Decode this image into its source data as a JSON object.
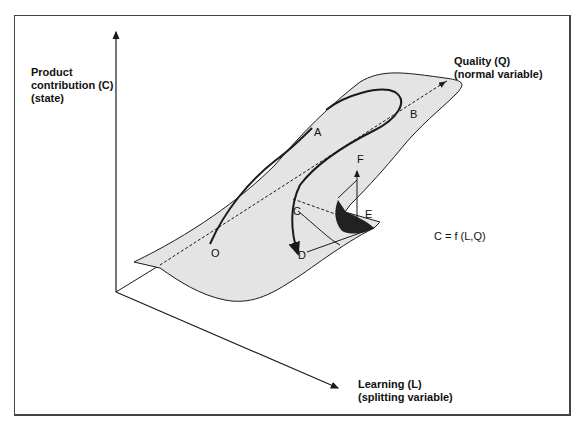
{
  "axes": {
    "vertical": {
      "line1": "Product",
      "line2": "contribution (C)",
      "line3": "(state)"
    },
    "quality": {
      "line1": "Quality (Q)",
      "line2": "(normal variable)"
    },
    "learning": {
      "line1": "Learning (L)",
      "line2": "(splitting variable)"
    }
  },
  "points": {
    "A": "A",
    "B": "B",
    "C": "C",
    "D": "D",
    "E": "E",
    "F": "F",
    "O": "O"
  },
  "equation": "C = f (L,Q)",
  "colors": {
    "surface": "#e4e4e4",
    "line": "#1a1a1a",
    "fold": "#222222",
    "frame": "#444444"
  }
}
